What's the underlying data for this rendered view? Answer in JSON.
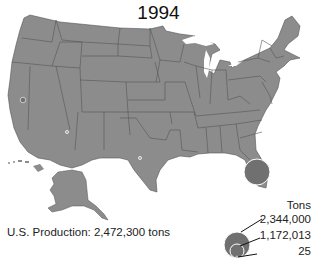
{
  "title": "1994",
  "production_text": "U.S. Production: 2,472,300 tons",
  "colors": {
    "land": "#8c8c8c",
    "border": "#555555",
    "circle_fill": "#707070",
    "circle_stroke": "#ffffff",
    "background": "#ffffff"
  },
  "legend": {
    "title": "Tons",
    "items": [
      {
        "label": "2,344,000",
        "value": 2344000
      },
      {
        "label": "1,172,013",
        "value": 1172013
      },
      {
        "label": "25",
        "value": 25
      }
    ]
  },
  "symbols": [
    {
      "state": "Florida",
      "tons": 2344000,
      "size": "large"
    },
    {
      "state": "California",
      "tons": null,
      "size": "small"
    },
    {
      "state": "Arizona",
      "tons": null,
      "size": "tiny"
    },
    {
      "state": "Texas",
      "tons": null,
      "size": "tiny"
    }
  ]
}
